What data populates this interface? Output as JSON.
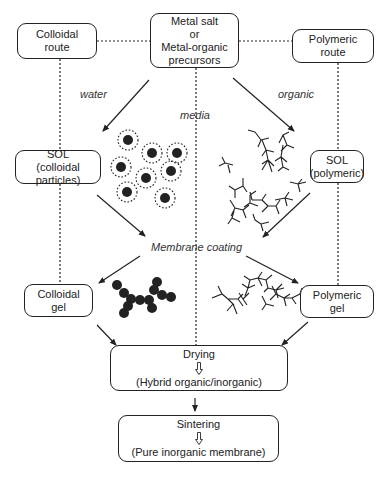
{
  "nodes": {
    "precursors": {
      "lines": [
        "Metal salt",
        "or",
        "Metal-organic",
        "precursors"
      ],
      "x": 150,
      "y": 13,
      "w": 89,
      "h": 55
    },
    "colloidal_route": {
      "lines": [
        "Colloidal",
        "route"
      ],
      "x": 17,
      "y": 23,
      "w": 80,
      "h": 36
    },
    "polymeric_route": {
      "lines": [
        "Polymeric",
        "route"
      ],
      "x": 292,
      "y": 29,
      "w": 82,
      "h": 34
    },
    "sol_colloidal": {
      "lines": [
        "SOL",
        "(colloidal particles)"
      ],
      "x": 15,
      "y": 150,
      "w": 86,
      "h": 34
    },
    "sol_polymeric": {
      "lines": [
        "SOL",
        "(polymeric)"
      ],
      "x": 310,
      "y": 150,
      "w": 54,
      "h": 33
    },
    "colloidal_gel": {
      "lines": [
        "Colloidal",
        "gel"
      ],
      "x": 24,
      "y": 284,
      "w": 69,
      "h": 33
    },
    "polymeric_gel": {
      "lines": [
        "Polymeric",
        "gel"
      ],
      "x": 300,
      "y": 285,
      "w": 74,
      "h": 33
    },
    "drying": {
      "top": "Drying",
      "bottom": "(Hybrid organic/inorganic)",
      "x": 110,
      "y": 345,
      "w": 178,
      "h": 46
    },
    "sintering": {
      "top": "Sintering",
      "bottom": "(Pure inorganic membrane)",
      "x": 118,
      "y": 415,
      "w": 161,
      "h": 47
    }
  },
  "labels": {
    "water": {
      "text": "water",
      "x": 80,
      "y": 88
    },
    "media": {
      "text": "media",
      "x": 180,
      "y": 109
    },
    "organic": {
      "text": "organic",
      "x": 278,
      "y": 88
    },
    "membrane_coating": {
      "text": "Membrane coating",
      "x": 151,
      "y": 241
    }
  },
  "colors": {
    "line": "#222222",
    "text": "#222222",
    "background": "#ffffff"
  },
  "dotted_lines": [
    [
      97,
      41,
      150,
      41
    ],
    [
      239,
      41,
      292,
      41
    ],
    [
      60,
      59,
      60,
      150
    ],
    [
      60,
      184,
      60,
      284
    ],
    [
      338,
      63,
      338,
      150
    ],
    [
      338,
      183,
      338,
      285
    ],
    [
      196,
      68,
      196,
      345
    ]
  ],
  "arrows": [
    [
      149,
      80,
      103,
      131
    ],
    [
      233,
      78,
      294,
      131
    ],
    [
      97,
      195,
      145,
      236
    ],
    [
      310,
      193,
      263,
      237
    ],
    [
      140,
      256,
      99,
      283
    ],
    [
      246,
      256,
      298,
      283
    ],
    [
      97,
      325,
      116,
      345
    ],
    [
      308,
      322,
      282,
      345
    ],
    [
      195,
      398,
      195,
      411
    ]
  ],
  "colloidal_particles": [
    [
      128,
      140
    ],
    [
      152,
      153
    ],
    [
      177,
      153
    ],
    [
      121,
      167
    ],
    [
      171,
      171
    ],
    [
      146,
      178
    ],
    [
      127,
      192
    ],
    [
      165,
      198
    ]
  ],
  "colloidal_gel_cluster": [
    [
      117,
      285
    ],
    [
      124,
      293
    ],
    [
      131,
      299
    ],
    [
      140,
      300
    ],
    [
      149,
      300
    ],
    [
      154,
      290
    ],
    [
      157,
      282
    ],
    [
      162,
      295
    ],
    [
      171,
      297
    ],
    [
      124,
      313
    ],
    [
      128,
      306
    ],
    [
      152,
      308
    ]
  ]
}
